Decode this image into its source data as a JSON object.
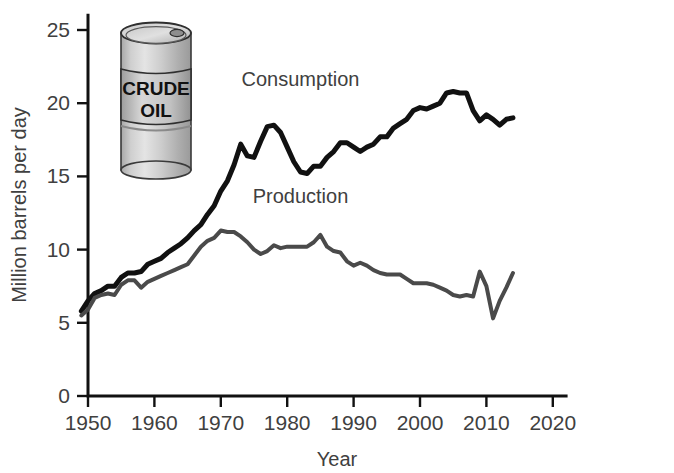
{
  "chart_data": {
    "type": "line",
    "title": "",
    "xlabel": "Year",
    "ylabel": "Million barrels per day",
    "xlim": [
      1945,
      2022
    ],
    "ylim": [
      0,
      26
    ],
    "grid": false,
    "legend_position": "inline-annotation",
    "xticks": [
      1950,
      1960,
      1970,
      1980,
      1990,
      2000,
      2010,
      2020
    ],
    "xtick_labels": [
      "1950",
      "1960",
      "1970",
      "1980",
      "1990",
      "2000",
      "2010",
      "2020"
    ],
    "yticks": [
      0,
      5,
      10,
      15,
      20,
      25
    ],
    "ytick_labels": [
      "0",
      "5",
      "10",
      "15",
      "20",
      "25"
    ],
    "x": [
      1949,
      1950,
      1951,
      1952,
      1953,
      1954,
      1955,
      1956,
      1957,
      1958,
      1959,
      1960,
      1961,
      1962,
      1963,
      1964,
      1965,
      1966,
      1967,
      1968,
      1969,
      1970,
      1971,
      1972,
      1973,
      1974,
      1975,
      1976,
      1977,
      1978,
      1979,
      1980,
      1981,
      1982,
      1983,
      1984,
      1985,
      1986,
      1987,
      1988,
      1989,
      1990,
      1991,
      1992,
      1993,
      1994,
      1995,
      1996,
      1997,
      1998,
      1999,
      2000,
      2001,
      2002,
      2003,
      2004,
      2005,
      2006,
      2007,
      2008,
      2009,
      2010,
      2011,
      2012,
      2013,
      2014
    ],
    "series": [
      {
        "name": "Consumption",
        "color": "#111111",
        "stroke_width": 5,
        "label_x": 1982,
        "label_y": 21.2,
        "values": [
          5.8,
          6.5,
          7.0,
          7.2,
          7.5,
          7.5,
          8.1,
          8.4,
          8.4,
          8.5,
          9.0,
          9.2,
          9.4,
          9.8,
          10.1,
          10.4,
          10.8,
          11.3,
          11.7,
          12.4,
          13.0,
          14.0,
          14.7,
          15.8,
          17.2,
          16.4,
          16.3,
          17.4,
          18.4,
          18.5,
          18.0,
          17.0,
          16.0,
          15.3,
          15.2,
          15.7,
          15.7,
          16.3,
          16.7,
          17.3,
          17.3,
          17.0,
          16.7,
          17.0,
          17.2,
          17.7,
          17.7,
          18.3,
          18.6,
          18.9,
          19.5,
          19.7,
          19.6,
          19.8,
          20.0,
          20.7,
          20.8,
          20.7,
          20.7,
          19.5,
          18.8,
          19.2,
          18.9,
          18.5,
          18.9,
          19.0
        ]
      },
      {
        "name": "Production",
        "color": "#4a4a4a",
        "stroke_width": 4,
        "label_x": 1982,
        "label_y": 13.2,
        "values": [
          5.5,
          5.9,
          6.7,
          6.9,
          7.0,
          6.9,
          7.6,
          7.9,
          7.9,
          7.4,
          7.8,
          8.0,
          8.2,
          8.4,
          8.6,
          8.8,
          9.0,
          9.6,
          10.2,
          10.6,
          10.8,
          11.3,
          11.2,
          11.2,
          10.9,
          10.5,
          10.0,
          9.7,
          9.9,
          10.3,
          10.1,
          10.2,
          10.2,
          10.2,
          10.2,
          10.5,
          11.0,
          10.2,
          9.9,
          9.8,
          9.2,
          8.9,
          9.1,
          8.9,
          8.6,
          8.4,
          8.3,
          8.3,
          8.3,
          8.0,
          7.7,
          7.7,
          7.7,
          7.6,
          7.4,
          7.2,
          6.9,
          6.8,
          6.9,
          6.8,
          8.5,
          7.5,
          5.3,
          6.5,
          7.4,
          8.4
        ]
      }
    ]
  },
  "illustration": {
    "name": "crude-oil-barrel",
    "label_line_1": "CRUDE",
    "label_line_2": "OIL",
    "body_light": "#dcdcdc",
    "body_mid": "#b6b6b6",
    "body_dark": "#9a9a9a",
    "outline": "#2f2f2f",
    "text_color": "#111111"
  }
}
